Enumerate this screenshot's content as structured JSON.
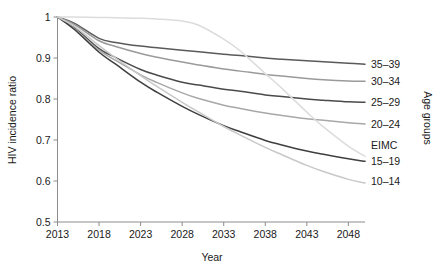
{
  "chart_data": {
    "type": "line",
    "title": "",
    "xlabel": "Year",
    "ylabel": "HIV incidence ratio",
    "legend_title": "Age groups",
    "legend_position": "right-inline",
    "grid": false,
    "xlim": [
      2013,
      2050
    ],
    "ylim": [
      0.5,
      1.0
    ],
    "xticks": [
      "2013",
      "2018",
      "2023",
      "2028",
      "2033",
      "2038",
      "2043",
      "2048"
    ],
    "xtick_values": [
      2013,
      2018,
      2023,
      2028,
      2033,
      2038,
      2043,
      2048
    ],
    "yticks": [
      "0.5",
      "0.6",
      "0.7",
      "0.8",
      "0.9",
      "1"
    ],
    "ytick_values": [
      0.5,
      0.6,
      0.7,
      0.8,
      0.9,
      1.0
    ],
    "x": [
      2013,
      2015,
      2018,
      2020,
      2023,
      2025,
      2028,
      2030,
      2033,
      2035,
      2038,
      2040,
      2043,
      2045,
      2048,
      2050
    ],
    "series": [
      {
        "name": "35-39",
        "label": "35–39",
        "color": "#5a5a5a",
        "label_y_value": 0.885,
        "values": [
          1.0,
          0.985,
          0.948,
          0.938,
          0.929,
          0.925,
          0.919,
          0.915,
          0.909,
          0.906,
          0.9,
          0.897,
          0.893,
          0.891,
          0.887,
          0.885
        ]
      },
      {
        "name": "30-34",
        "label": "30–34",
        "color": "#9a9a9a",
        "label_y_value": 0.843,
        "values": [
          1.0,
          0.982,
          0.942,
          0.928,
          0.911,
          0.902,
          0.89,
          0.883,
          0.873,
          0.868,
          0.86,
          0.856,
          0.85,
          0.847,
          0.844,
          0.843
        ]
      },
      {
        "name": "25-29",
        "label": "25–29",
        "color": "#4a4a4a",
        "label_y_value": 0.792,
        "values": [
          1.0,
          0.975,
          0.923,
          0.901,
          0.872,
          0.858,
          0.841,
          0.834,
          0.824,
          0.819,
          0.81,
          0.806,
          0.8,
          0.797,
          0.793,
          0.792
        ]
      },
      {
        "name": "20-24",
        "label": "20–24",
        "color": "#a8a8a8",
        "label_y_value": 0.739,
        "values": [
          1.0,
          0.972,
          0.919,
          0.894,
          0.859,
          0.84,
          0.815,
          0.801,
          0.785,
          0.777,
          0.766,
          0.76,
          0.752,
          0.748,
          0.742,
          0.739
        ]
      },
      {
        "name": "15-19",
        "label": "15–19",
        "color": "#3f3f3f",
        "label_y_value": 0.648,
        "values": [
          1.0,
          0.97,
          0.914,
          0.885,
          0.841,
          0.816,
          0.782,
          0.762,
          0.735,
          0.72,
          0.699,
          0.688,
          0.673,
          0.665,
          0.654,
          0.648
        ]
      },
      {
        "name": "EIMC",
        "label": "EIMC",
        "color": "#dcdcdc",
        "label_y_value": 0.686,
        "values": [
          1.0,
          1.0,
          0.999,
          0.998,
          0.997,
          0.995,
          0.99,
          0.98,
          0.946,
          0.917,
          0.862,
          0.826,
          0.768,
          0.732,
          0.685,
          0.66
        ]
      },
      {
        "name": "10-14",
        "label": "10–14",
        "color": "#c8c8c8",
        "label_y_value": 0.6,
        "values": [
          1.0,
          0.978,
          0.93,
          0.9,
          0.857,
          0.83,
          0.792,
          0.768,
          0.733,
          0.712,
          0.682,
          0.664,
          0.638,
          0.623,
          0.604,
          0.595
        ]
      }
    ]
  }
}
